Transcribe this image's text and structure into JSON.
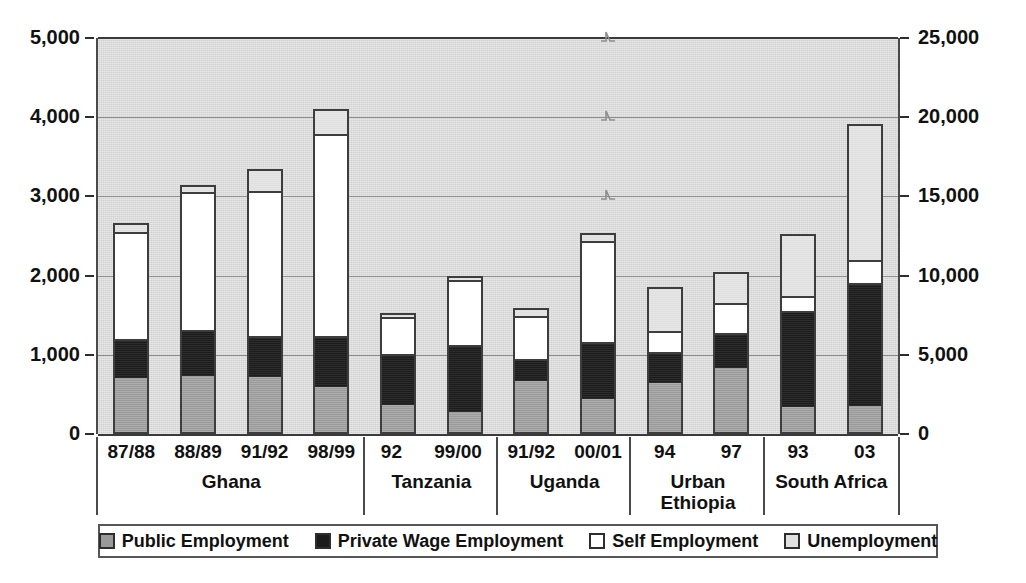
{
  "chart_data": {
    "type": "bar",
    "subtype": "stacked-column",
    "title": "",
    "subtitle": "",
    "xlabel": "",
    "ylabel": "",
    "grid": true,
    "legend_position": "bottom",
    "axis_break_note": "Scale break between Uganda and Urban Ethiopia: left axis applies to Ghana, Tanzania and Uganda; right axis applies to Urban Ethiopia and South Africa.",
    "left_axis": {
      "ticks": [
        "0",
        "1,000",
        "2,000",
        "3,000",
        "4,000",
        "5,000"
      ],
      "values": [
        0,
        1000,
        2000,
        3000,
        4000,
        5000
      ],
      "ylim": [
        0,
        5000
      ],
      "applies_to": [
        "Ghana",
        "Tanzania",
        "Uganda"
      ]
    },
    "right_axis": {
      "ticks": [
        "0",
        "5,000",
        "10,000",
        "15,000",
        "20,000",
        "25,000"
      ],
      "values": [
        0,
        5000,
        10000,
        15000,
        20000,
        25000
      ],
      "ylim": [
        0,
        25000
      ],
      "applies_to": [
        "Urban Ethiopia",
        "South Africa"
      ]
    },
    "series": [
      {
        "name": "Public Employment",
        "key": "public",
        "color": "#9a9a9a"
      },
      {
        "name": "Private Wage Employment",
        "key": "private",
        "color": "#1c1c1c"
      },
      {
        "name": "Self Employment",
        "key": "self",
        "color": "#ffffff"
      },
      {
        "name": "Unemployment",
        "key": "unemployment",
        "color": "#e0e0e0"
      }
    ],
    "groups": [
      {
        "name": "Ghana",
        "axis": "left",
        "bars": [
          {
            "category": "87/88",
            "public": 700,
            "private": 470,
            "self": 1380,
            "unemployment": 120,
            "total": 2670
          },
          {
            "category": "88/89",
            "public": 720,
            "private": 560,
            "self": 1770,
            "unemployment": 100,
            "total": 3150
          },
          {
            "category": "91/92",
            "public": 710,
            "private": 490,
            "self": 1860,
            "unemployment": 280,
            "total": 3340
          },
          {
            "category": "98/99",
            "public": 580,
            "private": 620,
            "self": 2590,
            "unemployment": 310,
            "total": 4100
          }
        ]
      },
      {
        "name": "Tanzania",
        "axis": "left",
        "bars": [
          {
            "category": "92",
            "public": 355,
            "private": 635,
            "self": 490,
            "unemployment": 50,
            "total": 1530
          },
          {
            "category": "99/00",
            "public": 255,
            "private": 845,
            "self": 840,
            "unemployment": 50,
            "total": 1990
          }
        ]
      },
      {
        "name": "Uganda",
        "axis": "left",
        "bars": [
          {
            "category": "91/92",
            "public": 670,
            "private": 255,
            "self": 565,
            "unemployment": 100,
            "total": 1590
          },
          {
            "category": "00/01",
            "public": 420,
            "private": 720,
            "self": 1300,
            "unemployment": 100,
            "total": 2540
          }
        ]
      },
      {
        "name": "Urban Ethiopia",
        "axis": "right",
        "bars": [
          {
            "category": "94",
            "public": 3150,
            "private": 1900,
            "self": 1400,
            "unemployment": 2800,
            "total": 9250
          },
          {
            "category": "97",
            "public": 4150,
            "private": 2100,
            "self": 1950,
            "unemployment": 2000,
            "total": 10200
          }
        ]
      },
      {
        "name": "South Africa",
        "axis": "right",
        "bars": [
          {
            "category": "93",
            "public": 1580,
            "private": 6070,
            "self": 950,
            "unemployment": 4050,
            "total": 12650
          },
          {
            "category": "03",
            "public": 1650,
            "private": 7750,
            "self": 1450,
            "unemployment": 8700,
            "total": 19550
          }
        ]
      }
    ]
  },
  "axes": {
    "left_ticks": [
      "5,000",
      "4,000",
      "3,000",
      "2,000",
      "1,000",
      "0"
    ],
    "right_ticks": [
      "25,000",
      "20,000",
      "15,000",
      "10,000",
      "5,000",
      "0"
    ]
  },
  "legend": {
    "items": [
      {
        "label": "Public Employment",
        "swatch": "public"
      },
      {
        "label": "Private Wage Employment",
        "swatch": "private"
      },
      {
        "label": "Self Employment",
        "swatch": "self"
      },
      {
        "label": "Unemployment",
        "swatch": "unemployment"
      }
    ]
  }
}
